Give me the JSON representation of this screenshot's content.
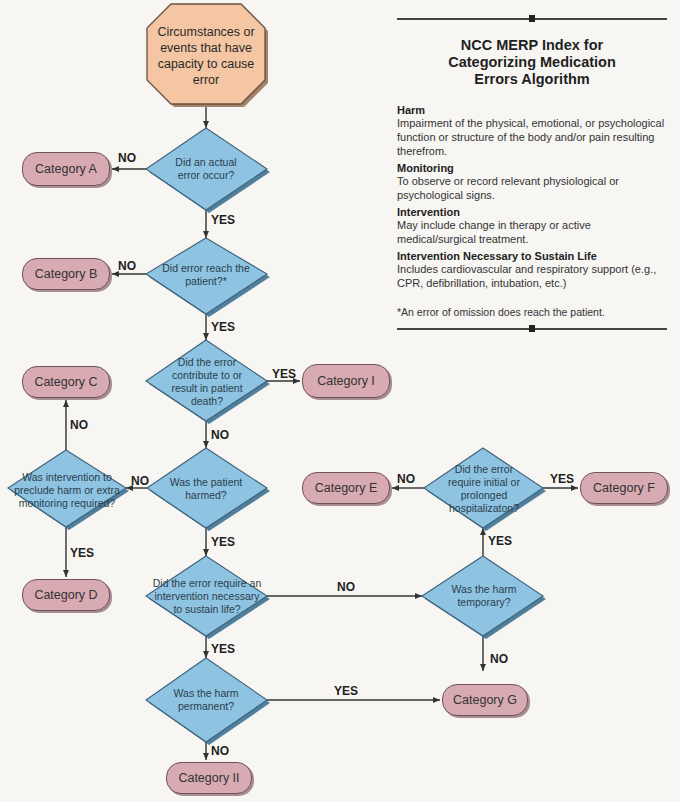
{
  "title": {
    "line1": "NCC MERP Index for",
    "line2": "Categorizing Medication",
    "line3": "Errors Algorithm"
  },
  "definitions": [
    {
      "term": "Harm",
      "definition": "Impairment of the physical, emotional, or psychological function or structure of the body and/or pain resulting therefrom."
    },
    {
      "term": "Monitoring",
      "definition": "To observe or record relevant physiological or psychological signs."
    },
    {
      "term": "Intervention",
      "definition": "May include change in therapy or active medical/surgical treatment."
    },
    {
      "term": "Intervention Necessary to Sustain Life",
      "definition": "Includes cardiovascular and respiratory support (e.g., CPR, defibrillation, intubation, etc.)"
    }
  ],
  "footnote": "*An error of omission does reach the patient.",
  "colors": {
    "start_fill": "#f4c6a3",
    "decision_fill": "#8ec3e2",
    "category_fill": "#d8aab2",
    "line": "#333333"
  },
  "start": {
    "text": "Circumstances or events that have capacity to cause error"
  },
  "decisions": {
    "actual_error": "Did an actual error occur?",
    "reach_patient": "Did error reach the patient?*",
    "contribute_death": "Did the error contribute to or result in patient death?",
    "patient_harmed": "Was the patient harmed?",
    "intervention_preclude": "Was intervention to preclude harm or extra monitoring required?",
    "sustain_life": "Did the error require an intervention necessary to sustain life?",
    "harm_temporary": "Was the harm temporary?",
    "hospitalization": "Did the error require initial or prolonged hospitalizaton?",
    "harm_permanent": "Was the harm permanent?"
  },
  "categories": {
    "A": "Category A",
    "B": "Category B",
    "C": "Category C",
    "D": "Category D",
    "E": "Category E",
    "F": "Category F",
    "G": "Category G",
    "H": "Category II",
    "I": "Category I"
  },
  "edge_labels": {
    "yes": "YES",
    "no": "NO"
  }
}
